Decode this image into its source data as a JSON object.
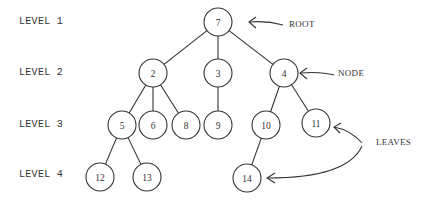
{
  "diagram": {
    "stroke_color": "#333333",
    "background": "#ffffff",
    "levels": [
      {
        "label": "LEVEL 1",
        "y": 22
      },
      {
        "label": "LEVEL 2",
        "y": 73
      },
      {
        "label": "LEVEL 3",
        "y": 125
      },
      {
        "label": "LEVEL 4",
        "y": 176
      }
    ],
    "nodes": [
      {
        "id": "7",
        "label": "7",
        "x": 218,
        "y": 22,
        "level": 1
      },
      {
        "id": "2",
        "label": "2",
        "x": 153,
        "y": 73,
        "level": 2
      },
      {
        "id": "3",
        "label": "3",
        "x": 218,
        "y": 73,
        "level": 2
      },
      {
        "id": "4",
        "label": "4",
        "x": 284,
        "y": 73,
        "level": 2
      },
      {
        "id": "5",
        "label": "5",
        "x": 122,
        "y": 125,
        "level": 3
      },
      {
        "id": "6",
        "label": "6",
        "x": 153,
        "y": 125,
        "level": 3
      },
      {
        "id": "8",
        "label": "8",
        "x": 186,
        "y": 125,
        "level": 3
      },
      {
        "id": "9",
        "label": "9",
        "x": 218,
        "y": 125,
        "level": 3
      },
      {
        "id": "10",
        "label": "10",
        "x": 266,
        "y": 125,
        "level": 3
      },
      {
        "id": "11",
        "label": "11",
        "x": 316,
        "y": 123,
        "level": 3
      },
      {
        "id": "12",
        "label": "12",
        "x": 100,
        "y": 177,
        "level": 4
      },
      {
        "id": "13",
        "label": "13",
        "x": 147,
        "y": 177,
        "level": 4
      },
      {
        "id": "14",
        "label": "14",
        "x": 247,
        "y": 178,
        "level": 4
      }
    ],
    "edges": [
      [
        "7",
        "2"
      ],
      [
        "7",
        "3"
      ],
      [
        "7",
        "4"
      ],
      [
        "2",
        "5"
      ],
      [
        "2",
        "6"
      ],
      [
        "2",
        "8"
      ],
      [
        "3",
        "9"
      ],
      [
        "4",
        "10"
      ],
      [
        "4",
        "11"
      ],
      [
        "5",
        "12"
      ],
      [
        "5",
        "13"
      ],
      [
        "10",
        "14"
      ]
    ],
    "annotations": {
      "root": {
        "label": "ROOT",
        "x": 289,
        "y": 25
      },
      "node": {
        "label": "NODE",
        "x": 338,
        "y": 74
      },
      "leaves": {
        "label": "LEAVES",
        "x": 376,
        "y": 143
      }
    }
  }
}
